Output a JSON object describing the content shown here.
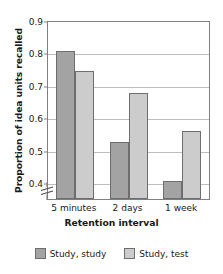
{
  "chart_data": {
    "type": "bar",
    "title": "",
    "xlabel": "Retention interval",
    "ylabel": "Proportion of idea units recalled",
    "categories": [
      "5 minutes",
      "2 days",
      "1 week"
    ],
    "series": [
      {
        "name": "Study, study",
        "values": [
          0.81,
          0.53,
          0.41
        ],
        "color": "#a3a3a3"
      },
      {
        "name": "Study, test",
        "values": [
          0.75,
          0.68,
          0.565
        ],
        "color": "#cccccc"
      }
    ],
    "ylim": [
      0.355,
      0.9
    ],
    "yticks": [
      0.4,
      0.5,
      0.6,
      0.7,
      0.8,
      0.9
    ],
    "ytick_labels": [
      "0.4",
      "0.5",
      "0.6",
      "0.7",
      "0.8",
      "0.9"
    ],
    "grid": true,
    "axis_break": true,
    "legend_position": "bottom",
    "bar_edge_color": "#6e6e6e",
    "grid_color": "#bdbdbd",
    "frame_color": "#808080"
  },
  "legend": {
    "entries": [
      {
        "label": "Study, study"
      },
      {
        "label": "Study, test"
      }
    ]
  }
}
